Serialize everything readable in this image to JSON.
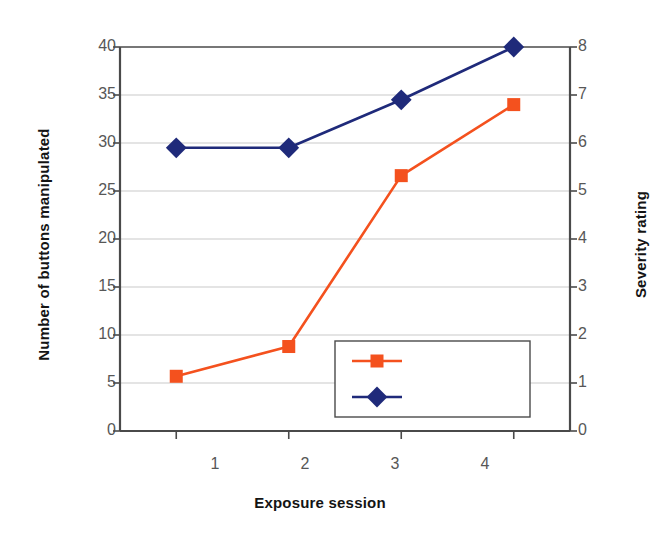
{
  "chart_data": {
    "type": "line",
    "title": "",
    "xlabel": "Exposure session",
    "ylabel": "Number of buttons manipulated",
    "y2label": "Severity rating",
    "categories": [
      "1",
      "2",
      "3",
      "4"
    ],
    "x": [
      1,
      2,
      3,
      4
    ],
    "xlim": [
      0.5,
      4.5
    ],
    "ylim": [
      0,
      40
    ],
    "y2lim": [
      0,
      8
    ],
    "yticks": [
      0,
      5,
      10,
      15,
      20,
      25,
      30,
      35,
      40
    ],
    "y2ticks": [
      0,
      1,
      2,
      3,
      4,
      5,
      6,
      7,
      8
    ],
    "grid": true,
    "legend_position": "bottom-center-inside",
    "series": [
      {
        "name": "# of buttons",
        "axis": "left",
        "color": "#F4511E",
        "marker": "square",
        "values": [
          5.7,
          8.8,
          26.6,
          34.0
        ]
      },
      {
        "name": "Severity rating",
        "axis": "right",
        "color": "#1F2A7A",
        "marker": "diamond",
        "values": [
          5.9,
          5.9,
          6.9,
          8.0
        ]
      }
    ]
  },
  "axes": {
    "left": {
      "label": "Number of buttons manipulated",
      "ticks": [
        "40",
        "35",
        "30",
        "25",
        "20",
        "15",
        "10",
        "5",
        "0"
      ]
    },
    "right": {
      "label": "Severity rating",
      "ticks": [
        "8",
        "7",
        "6",
        "5",
        "4",
        "3",
        "2",
        "1",
        "0"
      ]
    },
    "bottom": {
      "label": "Exposure session",
      "ticks": [
        "1",
        "2",
        "3",
        "4"
      ]
    }
  },
  "legend": {
    "items": [
      {
        "label": "# of buttons",
        "color": "#F4511E",
        "marker": "square"
      },
      {
        "label": "Severity rating",
        "color": "#1F2A7A",
        "marker": "diamond"
      }
    ]
  },
  "colors": {
    "buttons_series": "#F4511E",
    "severity_series": "#1F2A7A",
    "axis": "#4a4a4a",
    "grid": "#c9c9c9",
    "tick_text": "#575757",
    "title_text": "#141414",
    "background": "#ffffff"
  }
}
